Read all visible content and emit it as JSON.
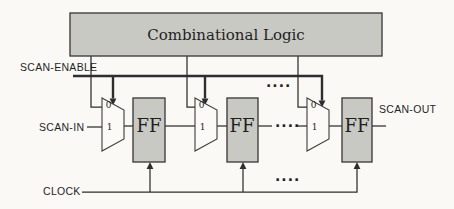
{
  "figure": {
    "background": "#faf9f6",
    "colors": {
      "box_fill": "#c9c9c4",
      "mux_fill": "#fbfaf7",
      "box_border": "#3c3c3c",
      "line": "#2e2e2e",
      "text": "#1f1f1f"
    }
  },
  "diagram": {
    "combinational_logic_label": "Combinational Logic",
    "signals": {
      "scan_enable": "SCAN-ENABLE",
      "scan_in": "SCAN-IN",
      "scan_out": "SCAN-OUT",
      "clock": "CLOCK"
    },
    "flip_flops": [
      "FF",
      "FF",
      "FF"
    ],
    "muxes": [
      {
        "input0": "0",
        "input1": "1"
      },
      {
        "input0": "0",
        "input1": "1"
      },
      {
        "input0": "0",
        "input1": "1"
      }
    ],
    "ellipsis": "...."
  }
}
